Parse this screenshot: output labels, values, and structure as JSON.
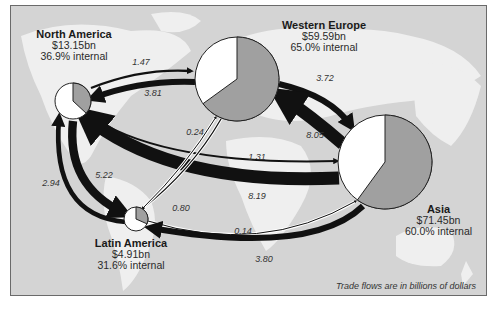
{
  "regions": [
    {
      "id": "north-america",
      "name": "North America",
      "value": "$13.15bn",
      "internal": "36.9% internal",
      "internal_pct": 36.9
    },
    {
      "id": "western-europe",
      "name": "Western Europe",
      "value": "$59.59bn",
      "internal": "65.0% internal",
      "internal_pct": 65.0
    },
    {
      "id": "asia",
      "name": "Asia",
      "value": "$71.45bn",
      "internal": "60.0% internal",
      "internal_pct": 60.0
    },
    {
      "id": "latin-america",
      "name": "Latin America",
      "value": "$4.91bn",
      "internal": "31.6% internal",
      "internal_pct": 31.6
    }
  ],
  "flows": [
    {
      "from": "north-america",
      "to": "western-europe",
      "value": 1.47,
      "label": "1.47"
    },
    {
      "from": "western-europe",
      "to": "north-america",
      "value": 3.81,
      "label": "3.81"
    },
    {
      "from": "western-europe",
      "to": "asia",
      "value": 3.72,
      "label": "3.72"
    },
    {
      "from": "asia",
      "to": "western-europe",
      "value": 8.05,
      "label": "8.05"
    },
    {
      "from": "north-america",
      "to": "asia",
      "value": 1.31,
      "label": "1.31"
    },
    {
      "from": "asia",
      "to": "north-america",
      "value": 8.19,
      "label": "8.19"
    },
    {
      "from": "western-europe",
      "to": "latin-america",
      "value": 0.8,
      "label": "0.80"
    },
    {
      "from": "latin-america",
      "to": "western-europe",
      "value": 0.24,
      "label": "0.24"
    },
    {
      "from": "north-america",
      "to": "latin-america",
      "value": 5.22,
      "label": "5.22"
    },
    {
      "from": "latin-america",
      "to": "north-america",
      "value": 2.94,
      "label": "2.94"
    },
    {
      "from": "latin-america",
      "to": "asia",
      "value": 0.14,
      "label": "0.14"
    },
    {
      "from": "asia",
      "to": "latin-america",
      "value": 3.8,
      "label": "3.80"
    }
  ],
  "footnote": "Trade flows are in billions of dollars",
  "colors": {
    "map_bg": "#d4d4d4",
    "land": "#f2f2f2",
    "pie_internal": "#a0a0a0",
    "pie_external": "#ffffff",
    "flow": "#111111"
  }
}
